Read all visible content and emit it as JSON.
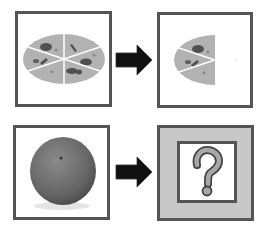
{
  "diagram": {
    "rows": [
      {
        "input": {
          "label": "pizza",
          "description": "whole pizza with six slices"
        },
        "arrow": "right-arrow",
        "output": {
          "label": "half pizza",
          "description": "pizza with right half removed"
        }
      },
      {
        "input": {
          "label": "orange",
          "description": "whole orange fruit"
        },
        "arrow": "right-arrow",
        "output": {
          "label": "?",
          "description": "unknown result"
        }
      }
    ]
  },
  "colors": {
    "frame_border": "#555555",
    "pizza_fill": "#b2b2b2",
    "topping": "#505050",
    "slice_line": "#ffffff",
    "arrow": "#111111",
    "unknown_bg": "#c8c8c8",
    "orange": "#6e6e6e"
  }
}
